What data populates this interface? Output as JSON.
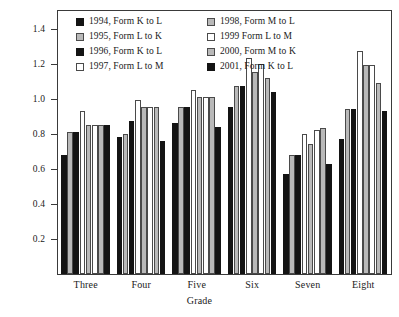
{
  "chart_data": {
    "type": "bar",
    "title": "",
    "xlabel": "Grade",
    "ylabel": "",
    "ylim": [
      0,
      1.5
    ],
    "ytick_values": [
      0.2,
      0.4,
      0.6,
      0.8,
      1.0,
      1.2,
      1.4
    ],
    "ytick_labels": [
      "0.2",
      "0.4",
      "0.6",
      "0.8",
      "1.0",
      "1.2",
      "1.4"
    ],
    "grid": false,
    "legend_position": "upper-center-inside",
    "categories": [
      "Three",
      "Four",
      "Five",
      "Six",
      "Seven",
      "Eight"
    ],
    "series": [
      {
        "name": "1994, Form K to L",
        "fill": "black",
        "values": [
          0.68,
          0.78,
          0.86,
          0.95,
          0.57,
          0.77
        ]
      },
      {
        "name": "1995, Form L to K",
        "fill": "gray",
        "values": [
          0.81,
          0.8,
          0.95,
          1.07,
          0.68,
          0.94
        ]
      },
      {
        "name": "1996, Form K to L",
        "fill": "black",
        "values": [
          0.81,
          0.87,
          0.95,
          1.07,
          0.68,
          0.94
        ]
      },
      {
        "name": "1997, Form L to M",
        "fill": "white",
        "values": [
          0.93,
          0.99,
          1.05,
          1.23,
          0.8,
          1.27
        ]
      },
      {
        "name": "1998, Form M to L",
        "fill": "gray",
        "values": [
          0.85,
          0.95,
          1.01,
          1.15,
          0.74,
          1.19
        ]
      },
      {
        "name": "1999 Form L to M",
        "fill": "white",
        "values": [
          0.85,
          0.95,
          1.01,
          1.2,
          0.82,
          1.19
        ]
      },
      {
        "name": "2000, Form M to K",
        "fill": "gray",
        "values": [
          0.85,
          0.95,
          1.01,
          1.12,
          0.83,
          1.09
        ]
      },
      {
        "name": "2001, Form K to L",
        "fill": "black",
        "values": [
          0.85,
          0.76,
          0.84,
          1.04,
          0.63,
          0.93
        ]
      }
    ]
  },
  "legend": {
    "left_column": [
      {
        "label": "1994, Form K to L",
        "fill": "black"
      },
      {
        "label": "1995, Form L to K",
        "fill": "gray"
      },
      {
        "label": "1996, Form K to L",
        "fill": "black"
      },
      {
        "label": "1997, Form L to M",
        "fill": "white"
      }
    ],
    "right_column": [
      {
        "label": "1998, Form M to L",
        "fill": "gray"
      },
      {
        "label": "1999 Form L to M",
        "fill": "white"
      },
      {
        "label": "2000, Form M to K",
        "fill": "gray"
      },
      {
        "label": "2001, Form K to L",
        "fill": "black"
      }
    ]
  },
  "colors": {
    "black": "#141414",
    "gray": "#b9b9b9",
    "white": "#ffffff",
    "outline": "#4a4a4a",
    "axis": "#3a3a3a",
    "text": "#1a1a1a",
    "background": "#ffffff"
  }
}
